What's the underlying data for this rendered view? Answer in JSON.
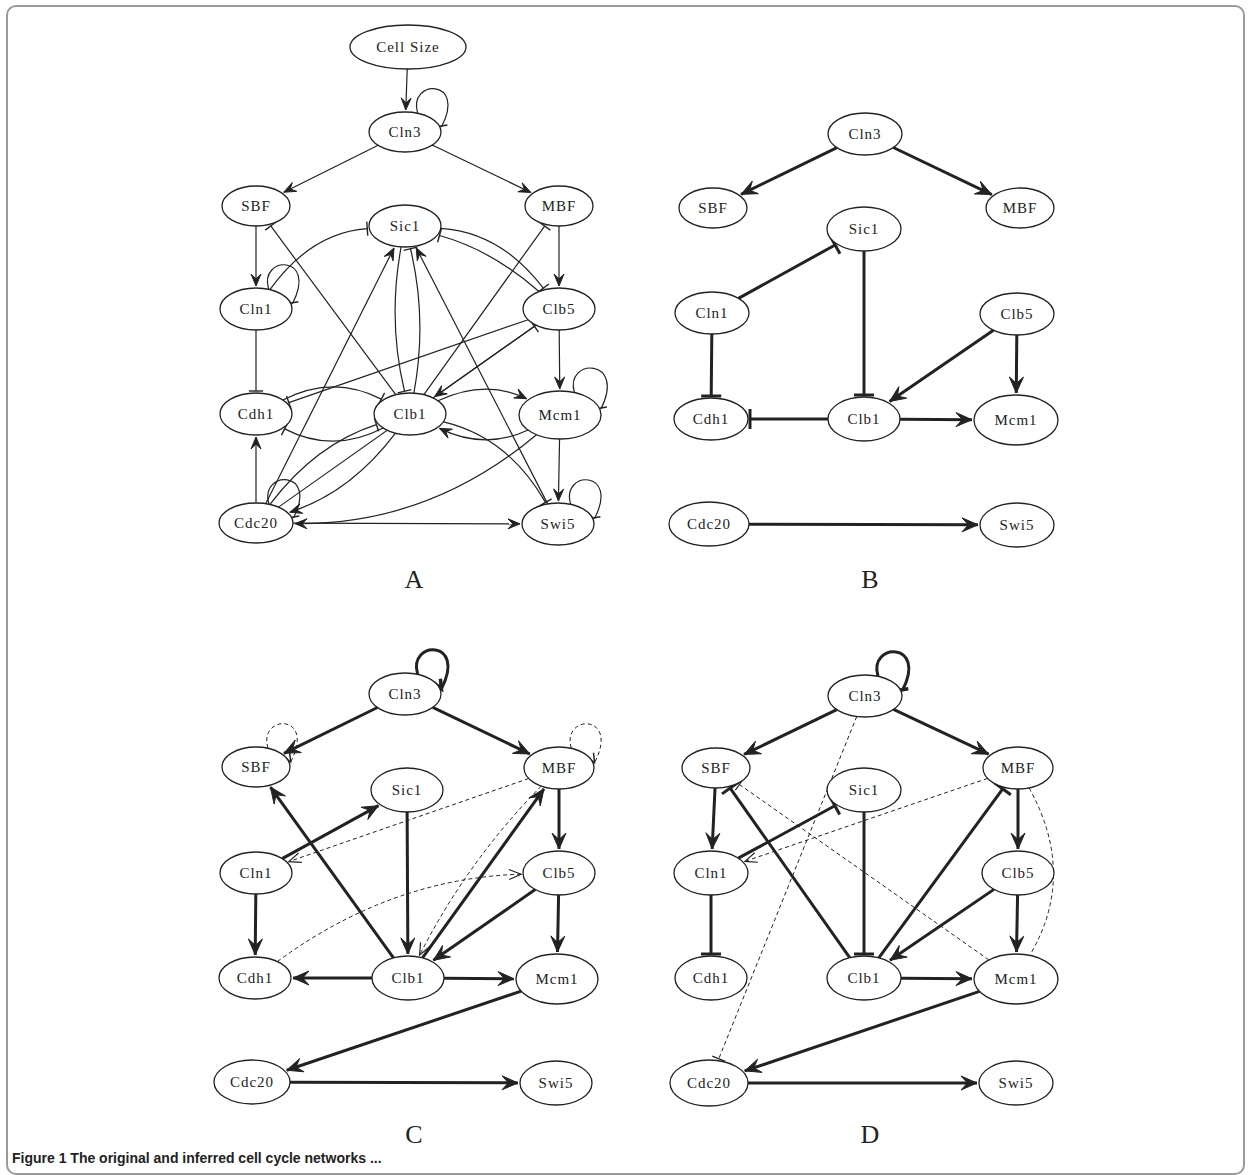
{
  "figure": {
    "caption_visible_fragment": "Figure 1 The original and inferred cell cycle networks ...",
    "panels": [
      {
        "id": "A",
        "label": "A",
        "label_pos": [
          414,
          588
        ],
        "style": "thin",
        "nodes": [
          {
            "id": "CellSize",
            "label": "Cell Size",
            "x": 408,
            "y": 47,
            "rx": 58,
            "ry": 22
          },
          {
            "id": "Cln3",
            "label": "Cln3",
            "x": 405,
            "y": 132,
            "rx": 36,
            "ry": 20
          },
          {
            "id": "SBF",
            "label": "SBF",
            "x": 256,
            "y": 206,
            "rx": 34,
            "ry": 20
          },
          {
            "id": "MBF",
            "label": "MBF",
            "x": 559,
            "y": 206,
            "rx": 34,
            "ry": 20
          },
          {
            "id": "Sic1",
            "label": "Sic1",
            "x": 405,
            "y": 226,
            "rx": 36,
            "ry": 21
          },
          {
            "id": "Cln1",
            "label": "Cln1",
            "x": 256,
            "y": 309,
            "rx": 36,
            "ry": 21
          },
          {
            "id": "Clb5",
            "label": "Clb5",
            "x": 559,
            "y": 309,
            "rx": 36,
            "ry": 21
          },
          {
            "id": "Cdh1",
            "label": "Cdh1",
            "x": 256,
            "y": 414,
            "rx": 36,
            "ry": 21
          },
          {
            "id": "Clb1",
            "label": "Clb1",
            "x": 410,
            "y": 414,
            "rx": 36,
            "ry": 21
          },
          {
            "id": "Mcm1",
            "label": "Mcm1",
            "x": 560,
            "y": 415,
            "rx": 41,
            "ry": 24
          },
          {
            "id": "Cdc20",
            "label": "Cdc20",
            "x": 256,
            "y": 523,
            "rx": 37,
            "ry": 20
          },
          {
            "id": "Swi5",
            "label": "Swi5",
            "x": 558,
            "y": 524,
            "rx": 36,
            "ry": 21
          }
        ],
        "edges": [
          {
            "from": "CellSize",
            "to": "Cln3",
            "type": "activate"
          },
          {
            "from": "Cln3",
            "to": "Cln3",
            "type": "inhibit",
            "self": true
          },
          {
            "from": "Cln3",
            "to": "SBF",
            "type": "activate"
          },
          {
            "from": "Cln3",
            "to": "MBF",
            "type": "activate"
          },
          {
            "from": "SBF",
            "to": "Cln1",
            "type": "activate"
          },
          {
            "from": "MBF",
            "to": "Clb5",
            "type": "activate"
          },
          {
            "from": "Cln1",
            "to": "Cln1",
            "type": "inhibit",
            "self": true
          },
          {
            "from": "Cln1",
            "to": "Sic1",
            "type": "inhibit",
            "curve": -20
          },
          {
            "from": "Cln1",
            "to": "Cdh1",
            "type": "inhibit"
          },
          {
            "from": "Clb1",
            "to": "SBF",
            "type": "inhibit"
          },
          {
            "from": "Clb1",
            "to": "MBF",
            "type": "inhibit"
          },
          {
            "from": "Sic1",
            "to": "Clb5",
            "type": "inhibit",
            "curve": -20
          },
          {
            "from": "Clb5",
            "to": "Sic1",
            "type": "inhibit",
            "curve": 10
          },
          {
            "from": "Sic1",
            "to": "Clb1",
            "type": "inhibit",
            "curve": 10
          },
          {
            "from": "Clb1",
            "to": "Sic1",
            "type": "inhibit",
            "curve": 10
          },
          {
            "from": "Cdc20",
            "to": "Sic1",
            "type": "activate"
          },
          {
            "from": "Swi5",
            "to": "Sic1",
            "type": "activate"
          },
          {
            "from": "Clb5",
            "to": "Cdh1",
            "type": "inhibit"
          },
          {
            "from": "Clb5",
            "to": "Mcm1",
            "type": "activate"
          },
          {
            "from": "Clb5",
            "to": "Clb1",
            "type": "activate"
          },
          {
            "from": "Clb1",
            "to": "Cdh1",
            "type": "inhibit",
            "curve": -20
          },
          {
            "from": "Cdh1",
            "to": "Clb1",
            "type": "inhibit",
            "curve": -20
          },
          {
            "from": "Clb1",
            "to": "Mcm1",
            "type": "activate",
            "curve": -18
          },
          {
            "from": "Mcm1",
            "to": "Clb1",
            "type": "activate",
            "curve": -18
          },
          {
            "from": "Mcm1",
            "to": "Mcm1",
            "type": "inhibit",
            "self": true
          },
          {
            "from": "Mcm1",
            "to": "Swi5",
            "type": "activate"
          },
          {
            "from": "Mcm1",
            "to": "Cdc20",
            "type": "activate",
            "curve": -30
          },
          {
            "from": "Clb1",
            "to": "Cdc20",
            "type": "activate",
            "curve": -15
          },
          {
            "from": "Cdc20",
            "to": "Clb1",
            "type": "inhibit",
            "curve": -15
          },
          {
            "from": "Cdc20",
            "to": "Clb5",
            "type": "inhibit"
          },
          {
            "from": "Cdc20",
            "to": "Cdh1",
            "type": "activate"
          },
          {
            "from": "Cdc20",
            "to": "Cdc20",
            "type": "inhibit",
            "self": true
          },
          {
            "from": "Cdc20",
            "to": "Swi5",
            "type": "activate"
          },
          {
            "from": "Clb1",
            "to": "Swi5",
            "type": "inhibit",
            "curve": -20
          },
          {
            "from": "Swi5",
            "to": "Swi5",
            "type": "inhibit",
            "self": true
          }
        ]
      },
      {
        "id": "B",
        "label": "B",
        "label_pos": [
          870,
          588
        ],
        "style": "thick",
        "nodes": [
          {
            "id": "Cln3",
            "label": "Cln3",
            "x": 865,
            "y": 134,
            "rx": 37,
            "ry": 21
          },
          {
            "id": "SBF",
            "label": "SBF",
            "x": 713,
            "y": 208,
            "rx": 34,
            "ry": 20
          },
          {
            "id": "MBF",
            "label": "MBF",
            "x": 1020,
            "y": 208,
            "rx": 34,
            "ry": 20
          },
          {
            "id": "Sic1",
            "label": "Sic1",
            "x": 864,
            "y": 229,
            "rx": 37,
            "ry": 22
          },
          {
            "id": "Cln1",
            "label": "Cln1",
            "x": 712,
            "y": 313,
            "rx": 37,
            "ry": 21
          },
          {
            "id": "Clb5",
            "label": "Clb5",
            "x": 1017,
            "y": 314,
            "rx": 37,
            "ry": 21
          },
          {
            "id": "Cdh1",
            "label": "Cdh1",
            "x": 711,
            "y": 419,
            "rx": 37,
            "ry": 21
          },
          {
            "id": "Clb1",
            "label": "Clb1",
            "x": 864,
            "y": 419,
            "rx": 36,
            "ry": 22
          },
          {
            "id": "Mcm1",
            "label": "Mcm1",
            "x": 1016,
            "y": 420,
            "rx": 42,
            "ry": 25
          },
          {
            "id": "Cdc20",
            "label": "Cdc20",
            "x": 709,
            "y": 524,
            "rx": 40,
            "ry": 22
          },
          {
            "id": "Swi5",
            "label": "Swi5",
            "x": 1017,
            "y": 525,
            "rx": 37,
            "ry": 22
          }
        ],
        "edges": [
          {
            "from": "Cln3",
            "to": "SBF",
            "type": "activate"
          },
          {
            "from": "Cln3",
            "to": "MBF",
            "type": "activate"
          },
          {
            "from": "Cln1",
            "to": "Sic1",
            "type": "inhibit"
          },
          {
            "from": "Cln1",
            "to": "Cdh1",
            "type": "inhibit"
          },
          {
            "from": "Sic1",
            "to": "Clb1",
            "type": "inhibit"
          },
          {
            "from": "Clb5",
            "to": "Clb1",
            "type": "activate"
          },
          {
            "from": "Clb5",
            "to": "Mcm1",
            "type": "activate"
          },
          {
            "from": "Clb1",
            "to": "Cdh1",
            "type": "inhibit"
          },
          {
            "from": "Clb1",
            "to": "Mcm1",
            "type": "activate"
          },
          {
            "from": "Cdc20",
            "to": "Swi5",
            "type": "activate"
          }
        ]
      },
      {
        "id": "C",
        "label": "C",
        "label_pos": [
          414,
          1143
        ],
        "style": "thick",
        "nodes": [
          {
            "id": "Cln3",
            "label": "Cln3",
            "x": 405,
            "y": 694,
            "rx": 36,
            "ry": 21
          },
          {
            "id": "SBF",
            "label": "SBF",
            "x": 256,
            "y": 767,
            "rx": 34,
            "ry": 20
          },
          {
            "id": "MBF",
            "label": "MBF",
            "x": 559,
            "y": 768,
            "rx": 35,
            "ry": 21
          },
          {
            "id": "Sic1",
            "label": "Sic1",
            "x": 407,
            "y": 790,
            "rx": 36,
            "ry": 22
          },
          {
            "id": "Cln1",
            "label": "Cln1",
            "x": 256,
            "y": 873,
            "rx": 36,
            "ry": 21
          },
          {
            "id": "Clb5",
            "label": "Clb5",
            "x": 559,
            "y": 873,
            "rx": 36,
            "ry": 22
          },
          {
            "id": "Cdh1",
            "label": "Cdh1",
            "x": 255,
            "y": 978,
            "rx": 36,
            "ry": 21
          },
          {
            "id": "Clb1",
            "label": "Clb1",
            "x": 408,
            "y": 978,
            "rx": 36,
            "ry": 22
          },
          {
            "id": "Mcm1",
            "label": "Mcm1",
            "x": 557,
            "y": 979,
            "rx": 41,
            "ry": 25
          },
          {
            "id": "Cdc20",
            "label": "Cdc20",
            "x": 252,
            "y": 1082,
            "rx": 38,
            "ry": 22
          },
          {
            "id": "Swi5",
            "label": "Swi5",
            "x": 556,
            "y": 1083,
            "rx": 36,
            "ry": 22
          }
        ],
        "edges": [
          {
            "from": "Cln3",
            "to": "Cln3",
            "type": "activate",
            "self": true
          },
          {
            "from": "Cln3",
            "to": "SBF",
            "type": "activate"
          },
          {
            "from": "Cln3",
            "to": "MBF",
            "type": "activate"
          },
          {
            "from": "SBF",
            "to": "SBF",
            "type": "activate",
            "self": true,
            "dashed": true
          },
          {
            "from": "MBF",
            "to": "MBF",
            "type": "activate",
            "self": true,
            "dashed": true
          },
          {
            "from": "Cln1",
            "to": "Sic1",
            "type": "activate"
          },
          {
            "from": "Cln1",
            "to": "Cdh1",
            "type": "activate"
          },
          {
            "from": "Sic1",
            "to": "Clb1",
            "type": "activate"
          },
          {
            "from": "Clb1",
            "to": "SBF",
            "type": "activate"
          },
          {
            "from": "Clb1",
            "to": "MBF",
            "type": "activate"
          },
          {
            "from": "MBF",
            "to": "Clb5",
            "type": "activate"
          },
          {
            "from": "MBF",
            "to": "Cln1",
            "type": "activate",
            "dashed": true
          },
          {
            "from": "MBF",
            "to": "Clb1",
            "type": "activate",
            "dashed": true,
            "curve": 10
          },
          {
            "from": "Cdh1",
            "to": "Clb5",
            "type": "activate",
            "dashed": true,
            "curve": -25
          },
          {
            "from": "Clb5",
            "to": "Clb1",
            "type": "activate"
          },
          {
            "from": "Clb5",
            "to": "Mcm1",
            "type": "activate"
          },
          {
            "from": "Clb1",
            "to": "Cdh1",
            "type": "activate"
          },
          {
            "from": "Clb1",
            "to": "Mcm1",
            "type": "activate"
          },
          {
            "from": "Mcm1",
            "to": "Cdc20",
            "type": "activate"
          },
          {
            "from": "Cdc20",
            "to": "Swi5",
            "type": "activate"
          }
        ]
      },
      {
        "id": "D",
        "label": "D",
        "label_pos": [
          870,
          1143
        ],
        "style": "thick",
        "nodes": [
          {
            "id": "Cln3",
            "label": "Cln3",
            "x": 865,
            "y": 696,
            "rx": 37,
            "ry": 21
          },
          {
            "id": "SBF",
            "label": "SBF",
            "x": 716,
            "y": 768,
            "rx": 34,
            "ry": 20
          },
          {
            "id": "MBF",
            "label": "MBF",
            "x": 1018,
            "y": 768,
            "rx": 35,
            "ry": 21
          },
          {
            "id": "Sic1",
            "label": "Sic1",
            "x": 864,
            "y": 790,
            "rx": 37,
            "ry": 22
          },
          {
            "id": "Cln1",
            "label": "Cln1",
            "x": 711,
            "y": 873,
            "rx": 37,
            "ry": 22
          },
          {
            "id": "Clb5",
            "label": "Clb5",
            "x": 1018,
            "y": 873,
            "rx": 36,
            "ry": 22
          },
          {
            "id": "Cdh1",
            "label": "Cdh1",
            "x": 711,
            "y": 978,
            "rx": 36,
            "ry": 22
          },
          {
            "id": "Clb1",
            "label": "Clb1",
            "x": 864,
            "y": 978,
            "rx": 37,
            "ry": 22
          },
          {
            "id": "Mcm1",
            "label": "Mcm1",
            "x": 1016,
            "y": 979,
            "rx": 42,
            "ry": 25
          },
          {
            "id": "Cdc20",
            "label": "Cdc20",
            "x": 709,
            "y": 1083,
            "rx": 39,
            "ry": 23
          },
          {
            "id": "Swi5",
            "label": "Swi5",
            "x": 1016,
            "y": 1083,
            "rx": 37,
            "ry": 22
          }
        ],
        "edges": [
          {
            "from": "Cln3",
            "to": "Cln3",
            "type": "inhibit",
            "self": true
          },
          {
            "from": "Cln3",
            "to": "SBF",
            "type": "activate"
          },
          {
            "from": "Cln3",
            "to": "MBF",
            "type": "activate"
          },
          {
            "from": "Cln3",
            "to": "Cdc20",
            "type": "inhibit",
            "dashed": true
          },
          {
            "from": "SBF",
            "to": "Cln1",
            "type": "activate"
          },
          {
            "from": "Mcm1",
            "to": "SBF",
            "type": "inhibit",
            "dashed": true
          },
          {
            "from": "Clb1",
            "to": "SBF",
            "type": "inhibit"
          },
          {
            "from": "Cln1",
            "to": "Sic1",
            "type": "inhibit"
          },
          {
            "from": "Cln1",
            "to": "Cdh1",
            "type": "inhibit"
          },
          {
            "from": "Sic1",
            "to": "Clb1",
            "type": "inhibit"
          },
          {
            "from": "Clb1",
            "to": "MBF",
            "type": "inhibit"
          },
          {
            "from": "MBF",
            "to": "Cln1",
            "type": "activate",
            "dashed": true
          },
          {
            "from": "MBF",
            "to": "Clb5",
            "type": "activate"
          },
          {
            "from": "MBF",
            "to": "Mcm1",
            "type": "none",
            "dashed": true,
            "curve": -30
          },
          {
            "from": "Clb5",
            "to": "Clb1",
            "type": "activate"
          },
          {
            "from": "Clb5",
            "to": "Mcm1",
            "type": "activate"
          },
          {
            "from": "Clb1",
            "to": "Mcm1",
            "type": "activate"
          },
          {
            "from": "Mcm1",
            "to": "Cdc20",
            "type": "activate"
          },
          {
            "from": "Cdc20",
            "to": "Swi5",
            "type": "activate"
          }
        ]
      }
    ]
  }
}
